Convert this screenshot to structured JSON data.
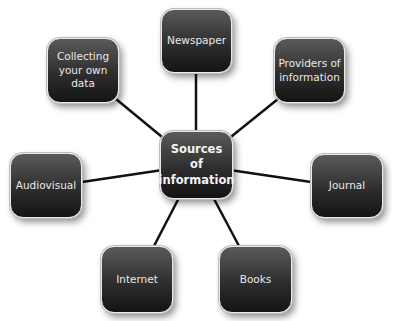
{
  "diagram": {
    "type": "hub-and-spoke",
    "center": {
      "id": "center",
      "label": "Sources\nof\ninformation"
    },
    "nodes": [
      {
        "id": "newspaper",
        "label": "Newspaper"
      },
      {
        "id": "providers",
        "label": "Providers of\ninformation"
      },
      {
        "id": "journal",
        "label": "Journal"
      },
      {
        "id": "books",
        "label": "Books"
      },
      {
        "id": "internet",
        "label": "Internet"
      },
      {
        "id": "audiovisual",
        "label": "Audiovisual"
      },
      {
        "id": "collecting",
        "label": "Collecting\nyour own\ndata"
      }
    ],
    "edges": [
      [
        "center",
        "newspaper"
      ],
      [
        "center",
        "providers"
      ],
      [
        "center",
        "journal"
      ],
      [
        "center",
        "books"
      ],
      [
        "center",
        "internet"
      ],
      [
        "center",
        "audiovisual"
      ],
      [
        "center",
        "collecting"
      ]
    ],
    "colors": {
      "node_fill_top": "#5a5a5a",
      "node_fill_bottom": "#141414",
      "node_text": "#e9e9e9",
      "connector": "#111111"
    }
  }
}
